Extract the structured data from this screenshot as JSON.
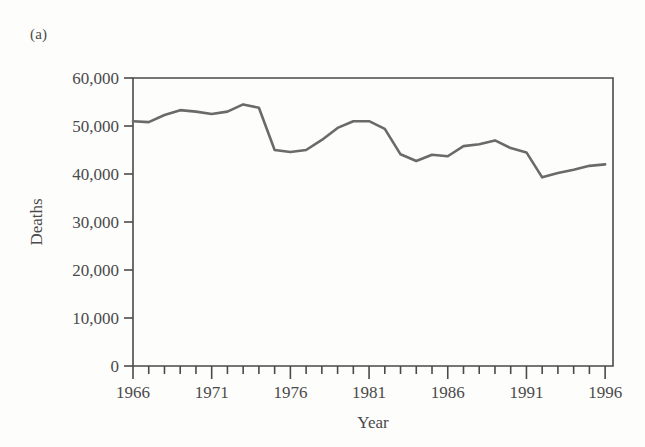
{
  "panel": {
    "label": "(a)"
  },
  "chart_data": {
    "type": "line",
    "title": "",
    "xlabel": "Year",
    "ylabel": "Deaths",
    "xlim": [
      1966,
      1996.5
    ],
    "ylim": [
      0,
      60000
    ],
    "grid": false,
    "legend": null,
    "line_color": "#6a6a6a",
    "frame_color": "#4a4a4a",
    "y_ticks": [
      0,
      10000,
      20000,
      30000,
      40000,
      50000,
      60000
    ],
    "y_tick_labels": [
      "0",
      "10,000",
      "20,000",
      "30,000",
      "40,000",
      "50,000",
      "60,000"
    ],
    "x_ticks": [
      1966,
      1967,
      1968,
      1969,
      1970,
      1971,
      1972,
      1973,
      1974,
      1975,
      1976,
      1977,
      1978,
      1979,
      1980,
      1981,
      1982,
      1983,
      1984,
      1985,
      1986,
      1987,
      1988,
      1989,
      1990,
      1991,
      1992,
      1993,
      1994,
      1995,
      1996
    ],
    "x_tick_labels": [
      "1966",
      "1971",
      "1976",
      "1981",
      "1986",
      "1991",
      "1996"
    ],
    "x_major_ticks": [
      1966,
      1971,
      1976,
      1981,
      1986,
      1991,
      1996
    ],
    "x": [
      1966,
      1967,
      1968,
      1969,
      1970,
      1971,
      1972,
      1973,
      1974,
      1975,
      1976,
      1977,
      1978,
      1979,
      1980,
      1981,
      1982,
      1983,
      1984,
      1985,
      1986,
      1987,
      1988,
      1989,
      1990,
      1991,
      1992,
      1993,
      1994,
      1995,
      1996
    ],
    "values": [
      51000,
      50800,
      52300,
      53300,
      53000,
      52500,
      53000,
      54500,
      53800,
      45000,
      44600,
      45000,
      47100,
      49600,
      51000,
      51000,
      49400,
      44100,
      42700,
      44000,
      43700,
      45800,
      46200,
      47000,
      45400,
      44500,
      39300,
      40200,
      40900,
      41700,
      42000
    ]
  }
}
